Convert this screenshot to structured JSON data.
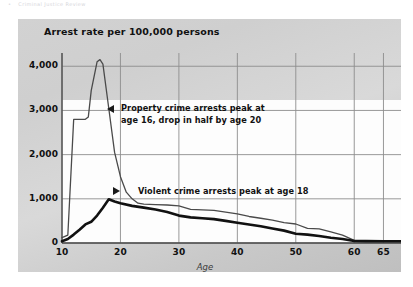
{
  "page": {
    "header_fragment_marker": "•",
    "header_fragment_text": "Criminal Justice Review"
  },
  "chart_data": {
    "type": "line",
    "title": "Arrest rate per 100,000 persons",
    "xlabel": "Age",
    "ylabel": "",
    "xlim": [
      10,
      68
    ],
    "ylim": [
      0,
      4300
    ],
    "grid": true,
    "legend_position": "none",
    "xticks": [
      10,
      20,
      30,
      40,
      50,
      60,
      65
    ],
    "xtick_labels": [
      "10",
      "20",
      "30",
      "40",
      "50",
      "60",
      "65"
    ],
    "yticks": [
      0,
      1000,
      2000,
      3000,
      4000
    ],
    "ytick_labels": [
      "0",
      "1,000",
      "2,000",
      "3,000",
      "4,000"
    ],
    "series": [
      {
        "name": "Property crime arrest rate",
        "style": "thin",
        "color": "#4a4a4a",
        "x": [
          10,
          11,
          12,
          13,
          14,
          14.5,
          15,
          16,
          16.5,
          17,
          18,
          19,
          20,
          21,
          22,
          23,
          24,
          26,
          28,
          30,
          32,
          34,
          36,
          38,
          40,
          42,
          44,
          46,
          48,
          50,
          52,
          54,
          56,
          58,
          60,
          62,
          65,
          68
        ],
        "y": [
          120,
          180,
          2800,
          2800,
          2800,
          2850,
          3450,
          4100,
          4150,
          4050,
          3050,
          2050,
          1500,
          1150,
          1000,
          900,
          880,
          870,
          860,
          840,
          760,
          750,
          740,
          700,
          660,
          600,
          560,
          520,
          460,
          430,
          330,
          320,
          250,
          180,
          60,
          55,
          50,
          45
        ]
      },
      {
        "name": "Violent crime arrest rate",
        "style": "thick",
        "color": "#111111",
        "x": [
          10,
          11,
          12,
          13,
          14,
          15,
          16,
          17,
          18,
          19,
          20,
          22,
          24,
          26,
          28,
          30,
          32,
          34,
          36,
          38,
          40,
          42,
          44,
          46,
          48,
          50,
          52,
          54,
          56,
          58,
          60,
          62,
          65,
          68
        ],
        "y": [
          40,
          90,
          190,
          300,
          420,
          480,
          620,
          800,
          990,
          940,
          900,
          840,
          800,
          760,
          700,
          620,
          580,
          560,
          540,
          500,
          460,
          420,
          380,
          330,
          280,
          210,
          190,
          160,
          120,
          90,
          45,
          42,
          40,
          38
        ]
      }
    ],
    "annotations": [
      {
        "id": "property-peak",
        "marker": "triangle-left",
        "line1": "Property crime arrests peak at",
        "line2": "age 16, drop in half by age 20"
      },
      {
        "id": "violent-peak",
        "marker": "triangle-right",
        "line1": "Violent crime arrests peak at age 18",
        "line2": ""
      }
    ]
  }
}
